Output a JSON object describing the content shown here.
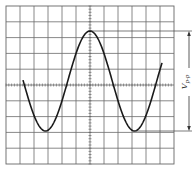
{
  "diagram": {
    "type": "oscilloscope-graticule",
    "grid": {
      "columns": 12,
      "rows": 10,
      "left": 6,
      "top": 6,
      "right": 174,
      "bottom": 164,
      "center_x": 91,
      "center_y": 84
    },
    "waveform": {
      "shape": "cosine",
      "description": "sinusoidal trace: starts near center line at left, trough, peak at center axis, trough, ends near center line at right",
      "peak_y": 31,
      "trough_y": 131
    },
    "measurement": {
      "label_main": "V",
      "label_sub": "p-p",
      "meaning": "peak-to-peak voltage"
    },
    "colors": {
      "grid": "#6a6a6a",
      "trace": "#1a1a1a",
      "background": "#ffffff"
    }
  }
}
